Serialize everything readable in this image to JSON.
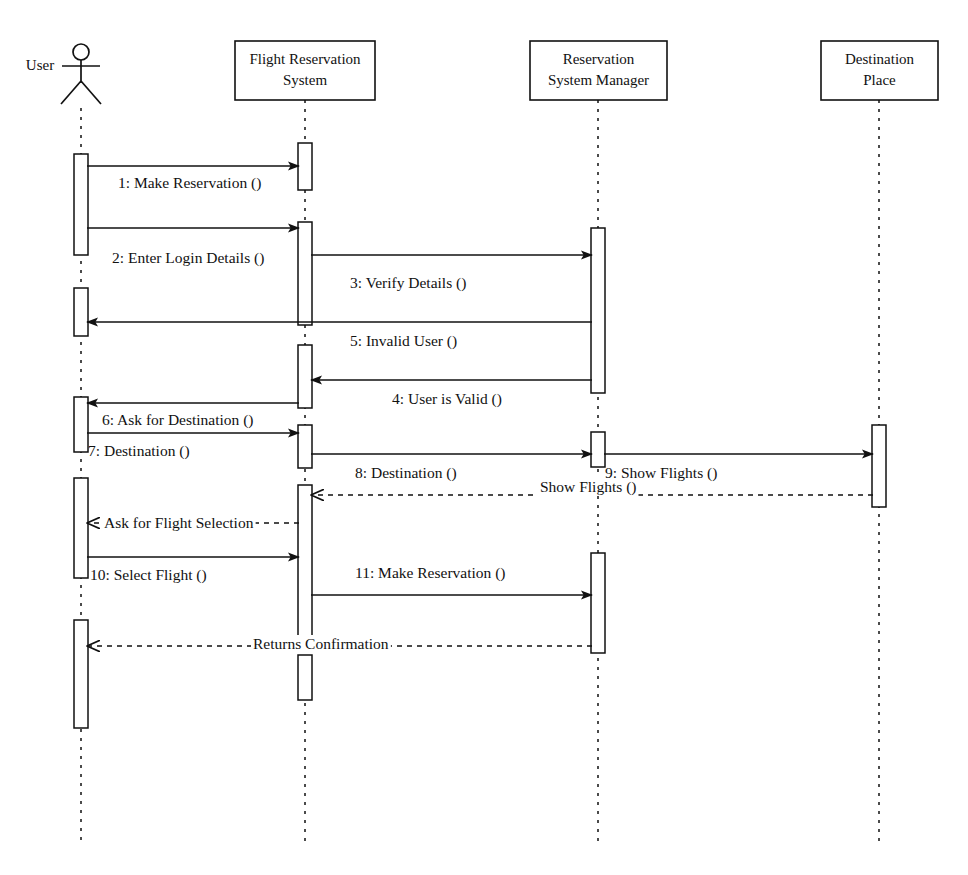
{
  "diagram": {
    "type": "uml-sequence-diagram",
    "lifelines": [
      {
        "id": "user",
        "label": "User",
        "kind": "actor",
        "x": 81,
        "label_x": 40,
        "label_y": 70
      },
      {
        "id": "frs",
        "label_line1": "Flight Reservation",
        "label_line2": "System",
        "kind": "object",
        "x": 305,
        "box_x": 235,
        "box_y": 41,
        "box_w": 140,
        "box_h": 59
      },
      {
        "id": "rsm",
        "label_line1": "Reservation",
        "label_line2": "System Manager",
        "kind": "object",
        "x": 598,
        "box_x": 530,
        "box_y": 41,
        "box_w": 137,
        "box_h": 59
      },
      {
        "id": "dest",
        "label_line1": "Destination",
        "label_line2": "Place",
        "kind": "object",
        "x": 879,
        "box_x": 821,
        "box_y": 41,
        "box_w": 117,
        "box_h": 59
      }
    ],
    "activations": [
      {
        "lifeline": "user",
        "y": 154,
        "h": 101
      },
      {
        "lifeline": "user",
        "y": 288,
        "h": 48
      },
      {
        "lifeline": "user",
        "y": 397,
        "h": 55
      },
      {
        "lifeline": "user",
        "y": 478,
        "h": 100
      },
      {
        "lifeline": "user",
        "y": 620,
        "h": 108
      },
      {
        "lifeline": "frs",
        "y": 143,
        "h": 47
      },
      {
        "lifeline": "frs",
        "y": 222,
        "h": 103
      },
      {
        "lifeline": "frs",
        "y": 345,
        "h": 63
      },
      {
        "lifeline": "frs",
        "y": 425,
        "h": 43
      },
      {
        "lifeline": "frs",
        "y": 485,
        "h": 160
      },
      {
        "lifeline": "frs",
        "y": 655,
        "h": 45
      },
      {
        "lifeline": "rsm",
        "y": 228,
        "h": 165
      },
      {
        "lifeline": "rsm",
        "y": 432,
        "h": 35
      },
      {
        "lifeline": "rsm",
        "y": 553,
        "h": 100
      },
      {
        "lifeline": "dest",
        "y": 425,
        "h": 82
      }
    ],
    "messages": [
      {
        "n": 1,
        "label": "1: Make Reservation ()",
        "from": "user",
        "to": "frs",
        "y": 166,
        "style": "solid",
        "dir": "right",
        "text_x": 118,
        "text_y": 188
      },
      {
        "n": 2,
        "label": "2: Enter Login Details ()",
        "from": "user",
        "to": "frs",
        "y": 228,
        "style": "solid",
        "dir": "right",
        "text_x": 112,
        "text_y": 263
      },
      {
        "n": 3,
        "label": "3: Verify Details ()",
        "from": "frs",
        "to": "rsm",
        "y": 255,
        "style": "solid",
        "dir": "right",
        "text_x": 350,
        "text_y": 288
      },
      {
        "n": 5,
        "label": "5: Invalid User ()",
        "from": "rsm",
        "to": "user",
        "y": 322,
        "style": "solid",
        "dir": "left",
        "text_x": 350,
        "text_y": 346
      },
      {
        "n": 4,
        "label": "4: User is Valid ()",
        "from": "rsm",
        "to": "frs",
        "y": 380,
        "style": "solid",
        "dir": "left",
        "text_x": 392,
        "text_y": 404
      },
      {
        "n": 6,
        "label": "6: Ask for Destination ()",
        "from": "frs",
        "to": "user",
        "y": 403,
        "style": "solid",
        "dir": "left",
        "text_x": 102,
        "text_y": 425
      },
      {
        "n": 7,
        "label": "7: Destination ()",
        "from": "user",
        "to": "frs",
        "y": 433,
        "style": "solid",
        "dir": "right",
        "text_x": 88,
        "text_y": 456
      },
      {
        "n": 8,
        "label": "8: Destination ()",
        "from": "frs",
        "to": "rsm",
        "y": 454,
        "style": "solid",
        "dir": "right",
        "text_x": 355,
        "text_y": 478
      },
      {
        "n": 9,
        "label": "9: Show Flights ()",
        "from": "rsm",
        "to": "dest",
        "y": 454,
        "style": "solid",
        "dir": "right",
        "text_x": 605,
        "text_y": 478
      },
      {
        "n": null,
        "label": "Show Flights ()",
        "from": "dest",
        "to": "frs",
        "y": 495,
        "style": "dashed",
        "dir": "left",
        "text_x": 540,
        "text_y": 492
      },
      {
        "n": null,
        "label": "Ask for Flight Selection",
        "from": "frs",
        "to": "user",
        "y": 523,
        "style": "dashed",
        "dir": "left",
        "text_x": 104,
        "text_y": 528
      },
      {
        "n": 10,
        "label": "10: Select Flight ()",
        "from": "user",
        "to": "frs",
        "y": 557,
        "style": "solid",
        "dir": "right",
        "text_x": 90,
        "text_y": 580
      },
      {
        "n": 11,
        "label": "11: Make Reservation ()",
        "from": "frs",
        "to": "rsm",
        "y": 595,
        "style": "solid",
        "dir": "right",
        "text_x": 355,
        "text_y": 578
      },
      {
        "n": null,
        "label": "Returns Confirmation",
        "from": "rsm",
        "to": "user",
        "y": 646,
        "style": "dashed",
        "dir": "left",
        "text_x": 253,
        "text_y": 649
      }
    ]
  }
}
